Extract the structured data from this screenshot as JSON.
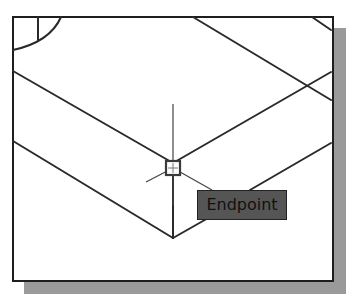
{
  "viewport": {
    "background": "#ffffff",
    "frame_color": "#1e1e1e",
    "shadow_color": "#9a9a9a"
  },
  "snap": {
    "type": "endpoint",
    "marker_icon": "endpoint-snap-marker-icon",
    "cursor_icon": "crosshair-cursor-icon"
  },
  "tooltip": {
    "label": "Endpoint",
    "background": "#555555"
  }
}
